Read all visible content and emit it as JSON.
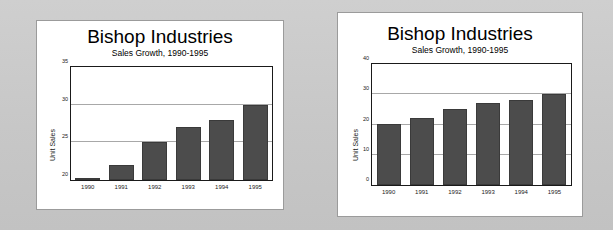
{
  "page": {
    "background_color": "#c9c9c9",
    "panel_color": "#ffffff",
    "bar_color": "#4c4c4c",
    "gridline_color": "#a8a8a8",
    "axis_color": "#1a1a1a"
  },
  "charts": [
    {
      "id": "left",
      "title": "Bishop Industries",
      "subtitle": "Sales Growth, 1990-1995",
      "ylabel": "Unit Sales"
    },
    {
      "id": "right",
      "title": "Bishop Industries",
      "subtitle": "Sales Growth, 1990-1995",
      "ylabel": "Unit Sales"
    }
  ],
  "chart_data": [
    {
      "type": "bar",
      "title": "Bishop Industries",
      "subtitle": "Sales Growth, 1990-1995",
      "xlabel": "",
      "ylabel": "Unit Sales",
      "categories": [
        "1990",
        "1991",
        "1992",
        "1993",
        "1994",
        "1995"
      ],
      "values": [
        20.2,
        22.0,
        25.0,
        27.0,
        28.0,
        30.0
      ],
      "ylim": [
        20,
        35
      ],
      "yticks": [
        20,
        25,
        30,
        35
      ],
      "grid": true,
      "legend": false,
      "bar_color": "#4c4c4c",
      "note": "Truncated y-axis starting at 20 exaggerates growth"
    },
    {
      "type": "bar",
      "title": "Bishop Industries",
      "subtitle": "Sales Growth, 1990-1995",
      "xlabel": "",
      "ylabel": "Unit Sales",
      "categories": [
        "1990",
        "1991",
        "1992",
        "1993",
        "1994",
        "1995"
      ],
      "values": [
        20.2,
        22.0,
        25.0,
        27.0,
        28.0,
        30.0
      ],
      "ylim": [
        0,
        40
      ],
      "yticks": [
        0,
        10,
        20,
        30,
        40
      ],
      "grid": true,
      "legend": false,
      "bar_color": "#4c4c4c",
      "note": "Full y-axis starting at 0 shows modest growth"
    }
  ]
}
